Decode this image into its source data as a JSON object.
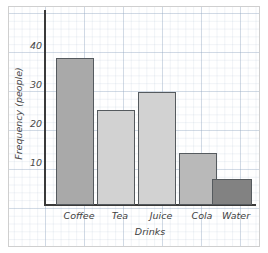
{
  "chart_data": {
    "type": "bar",
    "title": "",
    "categories": [
      "Coffee",
      "Tea",
      "Juice",
      "Cola",
      "Water"
    ],
    "values": [
      34,
      22,
      26,
      12,
      6
    ],
    "xlabel": "Drinks",
    "ylabel": "Frequency (people)",
    "ylim": [
      0,
      45
    ],
    "yticks": [
      10,
      20,
      30,
      40
    ],
    "ytick_labels": [
      "10",
      "20",
      "30",
      "40"
    ],
    "grid": true,
    "grid_style": "graph-paper",
    "legend": null,
    "bar_colors": [
      "#a9a9a9",
      "#d2d2d2",
      "#d2d2d2",
      "#b9b9b9",
      "#828282"
    ],
    "bar_border_color": "#555a5e"
  },
  "ytick_labels": {
    "t10": "10",
    "t20": "20",
    "t30": "30",
    "t40": "40"
  },
  "axis": {
    "y_title": "Frequency (people)",
    "x_title": "Drinks"
  },
  "categories": {
    "c0": "Coffee",
    "c1": "Tea",
    "c2": "Juice",
    "c3": "Cola",
    "c4": "Water"
  }
}
